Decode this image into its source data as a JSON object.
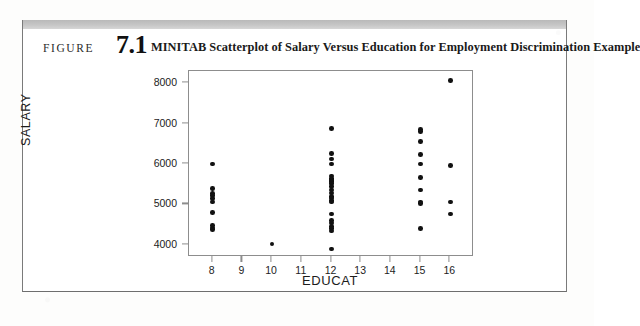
{
  "figure": {
    "label_word": "FIGURE",
    "number": "7.1",
    "title": "MINITAB Scatterplot of Salary Versus Education for Employment Discrimination Example"
  },
  "chart_data": {
    "type": "scatter",
    "title": "",
    "xlabel": "EDUCAT",
    "ylabel": "SALARY",
    "xlim": [
      7.2,
      16.8
    ],
    "ylim": [
      3700,
      8300
    ],
    "xticks": [
      8,
      9,
      10,
      11,
      12,
      13,
      14,
      15,
      16
    ],
    "yticks": [
      4000,
      5000,
      6000,
      7000,
      8000
    ],
    "grid": false,
    "legend": null,
    "marker": "filled-circle",
    "marker_color": "#111111",
    "points": [
      [
        8,
        5999
      ],
      [
        8,
        5400
      ],
      [
        8,
        5270
      ],
      [
        8,
        5220
      ],
      [
        8,
        5150
      ],
      [
        8,
        5060
      ],
      [
        8,
        4800
      ],
      [
        8,
        4480
      ],
      [
        8,
        4420
      ],
      [
        8,
        4380
      ],
      [
        10,
        4020
      ],
      [
        12,
        6880
      ],
      [
        12,
        6260
      ],
      [
        12,
        6120
      ],
      [
        12,
        6000
      ],
      [
        12,
        5700
      ],
      [
        12,
        5640
      ],
      [
        12,
        5600
      ],
      [
        12,
        5580
      ],
      [
        12,
        5560
      ],
      [
        12,
        5520
      ],
      [
        12,
        5440
      ],
      [
        12,
        5360
      ],
      [
        12,
        5280
      ],
      [
        12,
        5200
      ],
      [
        12,
        5160
      ],
      [
        12,
        5100
      ],
      [
        12,
        5060
      ],
      [
        12,
        4760
      ],
      [
        12,
        4600
      ],
      [
        12,
        4540
      ],
      [
        12,
        4460
      ],
      [
        12,
        4400
      ],
      [
        12,
        4340
      ],
      [
        12,
        3900
      ],
      [
        15,
        6860
      ],
      [
        15,
        6800
      ],
      [
        15,
        6560
      ],
      [
        15,
        6240
      ],
      [
        15,
        6000
      ],
      [
        15,
        5660
      ],
      [
        15,
        5360
      ],
      [
        15,
        5060
      ],
      [
        15,
        5020
      ],
      [
        15,
        4400
      ],
      [
        16,
        8060
      ],
      [
        16,
        5960
      ],
      [
        16,
        5060
      ],
      [
        16,
        4760
      ]
    ]
  }
}
